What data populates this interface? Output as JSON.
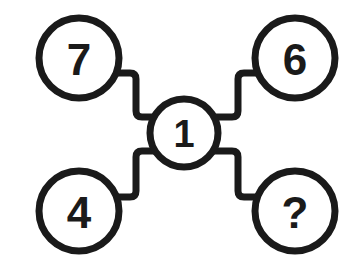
{
  "diagram": {
    "background_color": "#ffffff",
    "stroke_color": "#1a1a1a",
    "node_fill_color": "#ffffff",
    "text_color": "#1a1a1a",
    "stroke_width": 7,
    "connector_stroke_width": 7,
    "nodes": [
      {
        "id": "node-seven",
        "label": "7",
        "position": "top-left",
        "cx": 79,
        "cy": 58,
        "r": 40,
        "font_size": 44
      },
      {
        "id": "node-six",
        "label": "6",
        "position": "top-right",
        "cx": 295,
        "cy": 58,
        "r": 40,
        "font_size": 44
      },
      {
        "id": "node-one",
        "label": "1",
        "position": "center",
        "cx": 184,
        "cy": 133,
        "r": 34,
        "font_size": 38
      },
      {
        "id": "node-four",
        "label": "4",
        "position": "bottom-left",
        "cx": 79,
        "cy": 211,
        "r": 40,
        "font_size": 44
      },
      {
        "id": "node-question",
        "label": "?",
        "position": "bottom-right",
        "cx": 295,
        "cy": 211,
        "r": 40,
        "font_size": 44
      }
    ],
    "connectors": [
      {
        "id": "connector-seven-to-one",
        "from": "node-seven",
        "to": "node-one",
        "path": "M 115 73 L 130 73 Q 136 73 136 79 L 136 111 Q 136 117 142 117 L 154 117"
      },
      {
        "id": "connector-six-to-one",
        "from": "node-six",
        "to": "node-one",
        "path": "M 259 73 L 244 73 Q 238 73 238 79 L 238 111 Q 238 117 232 117 L 214 117"
      },
      {
        "id": "connector-four-to-one",
        "from": "node-four",
        "to": "node-one",
        "path": "M 115 197 L 130 197 Q 136 197 136 191 L 136 157 Q 136 151 142 151 L 154 151"
      },
      {
        "id": "connector-question-to-one",
        "from": "node-question",
        "to": "node-one",
        "path": "M 259 197 L 244 197 Q 238 197 238 191 L 238 157 Q 238 151 232 151 L 214 151"
      }
    ]
  }
}
